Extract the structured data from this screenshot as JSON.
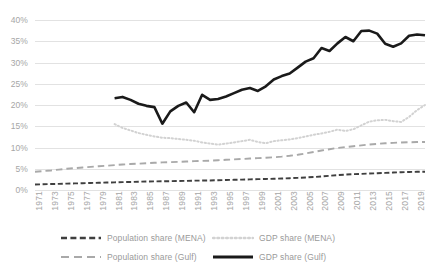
{
  "chart_data": {
    "type": "line",
    "title": "",
    "xlabel": "",
    "ylabel": "",
    "ylim": [
      0,
      40
    ],
    "y_ticks": [
      "0%",
      "5%",
      "10%",
      "15%",
      "20%",
      "25%",
      "30%",
      "35%",
      "40%"
    ],
    "y_tick_values": [
      0,
      5,
      10,
      15,
      20,
      25,
      30,
      35,
      40
    ],
    "grid": true,
    "legend_position": "bottom",
    "x": [
      1970,
      1971,
      1972,
      1973,
      1974,
      1975,
      1976,
      1977,
      1978,
      1979,
      1980,
      1981,
      1982,
      1983,
      1984,
      1985,
      1986,
      1987,
      1988,
      1989,
      1990,
      1991,
      1992,
      1993,
      1994,
      1995,
      1996,
      1997,
      1998,
      1999,
      2000,
      2001,
      2002,
      2003,
      2004,
      2005,
      2006,
      2007,
      2008,
      2009,
      2010,
      2011,
      2012,
      2013,
      2014,
      2015,
      2016,
      2017,
      2018,
      2019
    ],
    "x_tick_labels": [
      "1971",
      "1973",
      "1975",
      "1977",
      "1979",
      "1981",
      "1983",
      "1985",
      "1987",
      "1989",
      "1991",
      "1993",
      "1995",
      "1997",
      "1999",
      "2001",
      "2003",
      "2005",
      "2007",
      "2009",
      "2011",
      "2013",
      "2015",
      "2017",
      "2019"
    ],
    "series": [
      {
        "name": "Population share (MENA)",
        "style": "dashed",
        "color": "#3f3f3f",
        "width": 1.9,
        "dash": "5,2.6",
        "start_year": 1970,
        "values": [
          1.3,
          1.35,
          1.4,
          1.45,
          1.5,
          1.55,
          1.6,
          1.65,
          1.7,
          1.75,
          1.8,
          1.85,
          1.9,
          1.95,
          2.0,
          2.02,
          2.05,
          2.08,
          2.12,
          2.15,
          2.2,
          2.22,
          2.25,
          2.3,
          2.35,
          2.4,
          2.45,
          2.5,
          2.55,
          2.6,
          2.65,
          2.7,
          2.78,
          2.86,
          2.95,
          3.05,
          3.2,
          3.35,
          3.5,
          3.62,
          3.72,
          3.8,
          3.88,
          3.95,
          4.02,
          4.1,
          4.18,
          4.24,
          4.28,
          4.3
        ]
      },
      {
        "name": "Population share (Gulf)",
        "style": "dashed",
        "color": "#a9a9a9",
        "width": 1.9,
        "dash": "6.5,4",
        "start_year": 1970,
        "values": [
          4.3,
          4.45,
          4.6,
          4.8,
          5.0,
          5.15,
          5.3,
          5.45,
          5.6,
          5.7,
          5.85,
          6.0,
          6.1,
          6.2,
          6.3,
          6.4,
          6.5,
          6.55,
          6.62,
          6.7,
          6.8,
          6.85,
          6.9,
          7.0,
          7.1,
          7.2,
          7.3,
          7.4,
          7.5,
          7.6,
          7.7,
          7.85,
          8.05,
          8.3,
          8.6,
          8.95,
          9.3,
          9.6,
          9.9,
          10.1,
          10.3,
          10.5,
          10.7,
          10.85,
          11.0,
          11.1,
          11.18,
          11.24,
          11.28,
          11.3
        ]
      },
      {
        "name": "GDP share (MENA)",
        "style": "dotted",
        "color": "#d2d2d2",
        "width": 2.0,
        "dash": "1.3,2.4",
        "start_year": 1980,
        "values": [
          null,
          null,
          null,
          null,
          null,
          null,
          null,
          null,
          null,
          null,
          15.5,
          14.6,
          14.0,
          13.4,
          13.0,
          12.6,
          12.3,
          12.2,
          12.0,
          11.8,
          11.6,
          11.2,
          10.9,
          10.7,
          10.9,
          11.2,
          11.5,
          11.8,
          11.3,
          11.0,
          11.5,
          11.7,
          11.9,
          12.2,
          12.6,
          13.0,
          13.3,
          13.7,
          14.2,
          13.9,
          14.3,
          15.2,
          16.1,
          16.4,
          16.5,
          16.2,
          16.0,
          17.2,
          18.8,
          20.0
        ]
      },
      {
        "name": "GDP share (Gulf)",
        "style": "solid",
        "color": "#1a1a1a",
        "width": 2.6,
        "dash": "",
        "start_year": 1980,
        "values": [
          null,
          null,
          null,
          null,
          null,
          null,
          null,
          null,
          null,
          null,
          21.6,
          21.9,
          21.2,
          20.3,
          19.8,
          19.5,
          15.6,
          18.5,
          19.8,
          20.6,
          18.3,
          22.4,
          21.2,
          21.4,
          22.0,
          22.8,
          23.6,
          24.0,
          23.3,
          24.4,
          26.0,
          26.8,
          27.4,
          28.8,
          30.2,
          31.0,
          33.4,
          32.7,
          34.5,
          36.0,
          35.0,
          37.4,
          37.5,
          36.8,
          34.4,
          33.7,
          34.5,
          36.3,
          36.6,
          36.4
        ]
      }
    ]
  },
  "legend": {
    "items": [
      {
        "label": "Population share (MENA)",
        "swatch": "dashed-dark"
      },
      {
        "label": "GDP share (MENA)",
        "swatch": "dotted-light"
      },
      {
        "label": "Population share (Gulf)",
        "swatch": "dashed-gray"
      },
      {
        "label": "GDP share (Gulf)",
        "swatch": "solid-black"
      }
    ]
  }
}
